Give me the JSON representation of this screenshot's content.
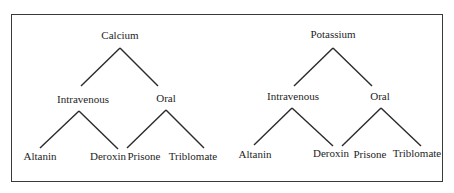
{
  "diagram": {
    "type": "tree",
    "trees": [
      {
        "root": "Calcium",
        "branches": [
          {
            "label": "Intravenous",
            "leaves": [
              "Altanin",
              "Deroxin"
            ]
          },
          {
            "label": "Oral",
            "leaves": [
              "Prisone",
              "Triblomate"
            ]
          }
        ]
      },
      {
        "root": "Potassium",
        "branches": [
          {
            "label": "Intravenous",
            "leaves": [
              "Altanin",
              "Deroxin"
            ]
          },
          {
            "label": "Oral",
            "leaves": [
              "Prisone",
              "Triblomate"
            ]
          }
        ]
      }
    ]
  }
}
